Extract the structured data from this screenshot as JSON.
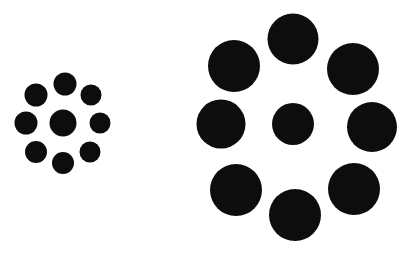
{
  "canvas": {
    "width": 416,
    "height": 254,
    "background_color": "#ffffff",
    "figure_color": "#0d0d0d",
    "title": "Ebbinghaus illusion"
  },
  "chart_data": {
    "type": "scatter",
    "xlabel": "",
    "ylabel": "",
    "xlim": [
      0,
      416
    ],
    "ylim": [
      0,
      254
    ],
    "grid": false,
    "legend": false,
    "series": [
      {
        "name": "left-cluster-center",
        "role": "center",
        "color": "#0d0d0d",
        "points": [
          {
            "cx": 63,
            "cy": 123,
            "r": 13.5
          }
        ]
      },
      {
        "name": "left-cluster-surround",
        "role": "surround",
        "color": "#0d0d0d",
        "ring_radius": 37,
        "count": 8,
        "points": [
          {
            "cx": 65,
            "cy": 84,
            "r": 11.5
          },
          {
            "cx": 91,
            "cy": 95,
            "r": 10.5
          },
          {
            "cx": 100,
            "cy": 123,
            "r": 10.5
          },
          {
            "cx": 90,
            "cy": 152,
            "r": 10.5
          },
          {
            "cx": 63,
            "cy": 163,
            "r": 11.0
          },
          {
            "cx": 36,
            "cy": 152,
            "r": 11.0
          },
          {
            "cx": 26,
            "cy": 123,
            "r": 11.5
          },
          {
            "cx": 36,
            "cy": 95,
            "r": 11.5
          }
        ]
      },
      {
        "name": "right-cluster-center",
        "role": "center",
        "color": "#0d0d0d",
        "points": [
          {
            "cx": 293,
            "cy": 124,
            "r": 21.0
          }
        ]
      },
      {
        "name": "right-cluster-surround",
        "role": "surround",
        "color": "#0d0d0d",
        "ring_radius": 79,
        "count": 8,
        "points": [
          {
            "cx": 293,
            "cy": 39,
            "r": 25.5
          },
          {
            "cx": 353,
            "cy": 69,
            "r": 26.0
          },
          {
            "cx": 372,
            "cy": 127,
            "r": 25.0
          },
          {
            "cx": 354,
            "cy": 189,
            "r": 26.0
          },
          {
            "cx": 295,
            "cy": 215,
            "r": 26.0
          },
          {
            "cx": 236,
            "cy": 190,
            "r": 26.0
          },
          {
            "cx": 221,
            "cy": 124,
            "r": 24.5
          },
          {
            "cx": 234,
            "cy": 66,
            "r": 26.0
          }
        ]
      }
    ]
  }
}
